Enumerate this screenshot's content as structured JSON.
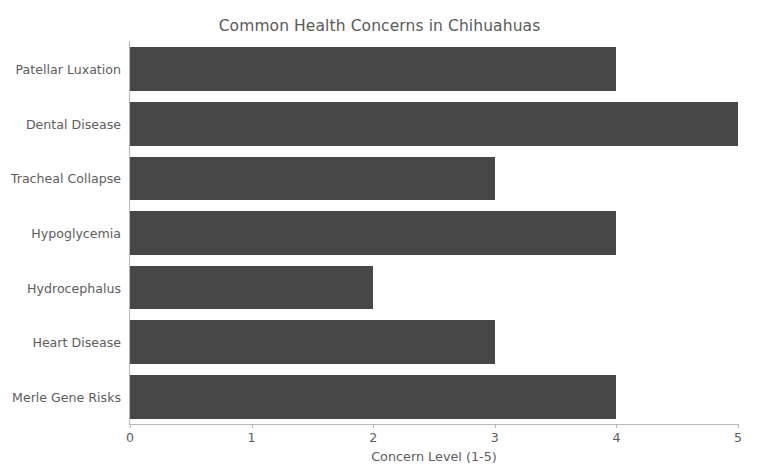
{
  "chart_data": {
    "type": "bar",
    "orientation": "horizontal",
    "title": "Common Health Concerns in Chihuahuas",
    "xlabel": "Concern Level (1-5)",
    "ylabel": "",
    "categories": [
      "Patellar Luxation",
      "Dental Disease",
      "Tracheal Collapse",
      "Hypoglycemia",
      "Hydrocephalus",
      "Heart Disease",
      "Merle Gene Risks"
    ],
    "values": [
      4,
      5,
      3,
      4,
      2,
      3,
      4
    ],
    "xlim": [
      0,
      5
    ],
    "xticks": [
      0,
      1,
      2,
      3,
      4,
      5
    ],
    "xtick_labels": [
      "0",
      "1",
      "2",
      "3",
      "4",
      "5"
    ],
    "grid": false,
    "legend": false,
    "bar_color": "#474747",
    "background_color": "#ffffff",
    "text_color": "#5d5d5d",
    "axis_color": "#b8b8b8"
  }
}
